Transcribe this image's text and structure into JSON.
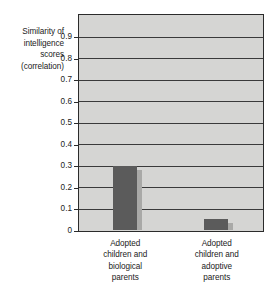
{
  "chart_data": {
    "type": "bar",
    "title": "",
    "subtitle": "",
    "xlabel": "",
    "ylabel": "Similarity of intelligence scores (correlation)",
    "ylabel_lines": [
      "Similarity of",
      "intelligence",
      "scores",
      "(correlation)"
    ],
    "categories": [
      "Adopted children and biological parents",
      "Adopted children and adoptive parents"
    ],
    "category_lines": [
      [
        "Adopted",
        "children and",
        "biological",
        "parents"
      ],
      [
        "Adopted",
        "children and",
        "adoptive",
        "parents"
      ]
    ],
    "values": [
      0.3,
      0.05
    ],
    "ylim": [
      0,
      1.0
    ],
    "yticks": [
      0,
      0.1,
      0.2,
      0.3,
      0.4,
      0.5,
      0.6,
      0.7,
      0.8,
      0.9
    ],
    "ytick_labels": [
      "0",
      "0.1",
      "0.2",
      "0.3",
      "0.4",
      "0.5",
      "0.6",
      "0.7",
      "0.8",
      "0.9"
    ],
    "gridlines": [
      0.1,
      0.2,
      0.3,
      0.4,
      0.5,
      0.6,
      0.7,
      0.8,
      0.9
    ],
    "grid": true,
    "legend": false,
    "legend_position": "none",
    "colors": {
      "bar_fill": "#5b5b5b",
      "bar_shadow": "#a9a9a7",
      "plot_background": "#d5d5d3",
      "gridline": "#3a3a3a",
      "axis_border": "#2b2b2b",
      "text": "#222222",
      "page_background": "#ffffff"
    }
  }
}
